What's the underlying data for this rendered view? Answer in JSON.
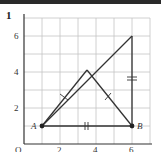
{
  "header": {
    "bar_color": "#2a2a2a"
  },
  "problem": {
    "number": "1"
  },
  "axes": {
    "origin_label": "O",
    "x_ticks": [
      "2",
      "4",
      "6"
    ],
    "y_ticks": [
      "2",
      "4",
      "6"
    ],
    "grid_range": {
      "x": [
        0,
        7
      ],
      "y": [
        0,
        7
      ]
    }
  },
  "points": {
    "A": {
      "label": "A",
      "x": 1,
      "y": 1
    },
    "B": {
      "label": "B",
      "x": 6,
      "y": 1
    },
    "C": {
      "label": "",
      "x": 6,
      "y": 6
    },
    "D": {
      "label": "",
      "x": 3.5,
      "y": 4
    }
  },
  "segments": [
    {
      "from": "A",
      "to": "B",
      "mark": "double-tick (||)"
    },
    {
      "from": "B",
      "to": "C",
      "mark": "double-tick (=)"
    },
    {
      "from": "A",
      "to": "C",
      "mark": "none"
    },
    {
      "from": "A",
      "to": "D",
      "mark": "single-tick"
    },
    {
      "from": "D",
      "to": "B",
      "mark": "single-tick"
    }
  ],
  "colors": {
    "grid": "#bdbdbd",
    "axis": "#333333",
    "line": "#333333"
  }
}
